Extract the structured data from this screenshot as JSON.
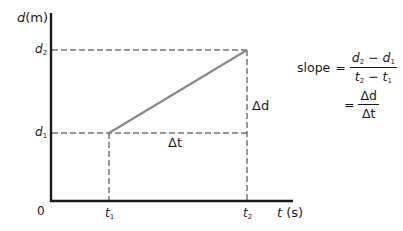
{
  "diagram": {
    "type": "distance-time graph",
    "y_axis": {
      "symbol": "d",
      "unit": "(m)"
    },
    "x_axis": {
      "symbol": "t",
      "unit": "(s)"
    },
    "origin_label": "0",
    "points": {
      "d1": {
        "symbol": "d",
        "subscript": "1"
      },
      "d2": {
        "symbol": "d",
        "subscript": "2"
      },
      "t1": {
        "symbol": "t",
        "subscript": "1"
      },
      "t2": {
        "symbol": "t",
        "subscript": "2"
      }
    },
    "delta_d": "Δd",
    "delta_t": "Δt",
    "line_color": "#8a8a8a",
    "axis_color": "#1a1a1a",
    "dash_color": "#333333"
  },
  "formula": {
    "lhs": "slope",
    "eq": "=",
    "frac1": {
      "num": {
        "a": "d",
        "a_sub": "2",
        "op": "−",
        "b": "d",
        "b_sub": "1"
      },
      "den": {
        "a": "t",
        "a_sub": "2",
        "op": "−",
        "b": "t",
        "b_sub": "1"
      }
    },
    "frac2": {
      "num": "Δd",
      "den": "Δt"
    }
  }
}
